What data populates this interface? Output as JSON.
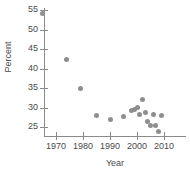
{
  "chart_data": {
    "type": "scatter",
    "title": "",
    "xlabel": "Year",
    "ylabel": "Percent",
    "xlim": [
      1964,
      2012
    ],
    "ylim": [
      23,
      56
    ],
    "grid": false,
    "legend": null,
    "marker_color": "#8e8e8e",
    "axis_color": "#8a8a8a",
    "text_color": "#4a4a4a",
    "xticks": [
      1970,
      1980,
      1990,
      2000,
      2010
    ],
    "xtick_labels": [
      "1970",
      "1980",
      "1990",
      "2000",
      "2010"
    ],
    "yticks": [
      25,
      30,
      35,
      40,
      45,
      50,
      55
    ],
    "ytick_labels": [
      "25",
      "30",
      "35",
      "40",
      "45",
      "50",
      "55"
    ],
    "x": [
      1965,
      1974,
      1979,
      1985,
      1990,
      1995,
      1998,
      1999,
      2000,
      2001,
      2002,
      2003,
      2004,
      2005,
      2006,
      2007,
      2008,
      2009
    ],
    "y": [
      54.0,
      42.2,
      35.0,
      28.0,
      26.8,
      27.8,
      29.2,
      29.4,
      30.0,
      28.2,
      32.0,
      28.6,
      26.5,
      25.4,
      28.2,
      25.4,
      23.9,
      28.0
    ],
    "points": [
      {
        "x": 1965,
        "y": 54.0
      },
      {
        "x": 1974,
        "y": 42.2
      },
      {
        "x": 1979,
        "y": 35.0
      },
      {
        "x": 1985,
        "y": 28.0
      },
      {
        "x": 1990,
        "y": 26.8
      },
      {
        "x": 1995,
        "y": 27.8
      },
      {
        "x": 1998,
        "y": 29.2
      },
      {
        "x": 1999,
        "y": 29.4
      },
      {
        "x": 2000,
        "y": 30.0
      },
      {
        "x": 2001,
        "y": 28.2
      },
      {
        "x": 2002,
        "y": 32.0
      },
      {
        "x": 2003,
        "y": 28.6
      },
      {
        "x": 2004,
        "y": 26.5
      },
      {
        "x": 2005,
        "y": 25.4
      },
      {
        "x": 2006,
        "y": 28.2
      },
      {
        "x": 2007,
        "y": 25.4
      },
      {
        "x": 2008,
        "y": 23.9
      },
      {
        "x": 2009,
        "y": 28.0
      }
    ]
  }
}
